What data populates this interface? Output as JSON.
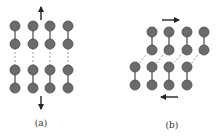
{
  "colors": {
    "atom_fill": "#6b6b6b",
    "atom_stroke": "#4a4a4a",
    "bond": "#555555",
    "broken_bond": "#9a9a9a",
    "arrow": "#222222"
  },
  "panels": [
    {
      "label": "(a)",
      "label_pos": [
        41,
        118
      ],
      "atoms": [
        [
          15,
          26
        ],
        [
          33,
          26
        ],
        [
          50,
          26
        ],
        [
          68,
          26
        ],
        [
          15,
          44
        ],
        [
          33,
          44
        ],
        [
          50,
          44
        ],
        [
          68,
          44
        ],
        [
          15,
          70
        ],
        [
          33,
          70
        ],
        [
          50,
          70
        ],
        [
          68,
          70
        ],
        [
          15,
          88
        ],
        [
          33,
          88
        ],
        [
          50,
          88
        ],
        [
          68,
          88
        ]
      ],
      "bonds": [
        [
          [
            15,
            26
          ],
          [
            15,
            44
          ]
        ],
        [
          [
            33,
            26
          ],
          [
            33,
            44
          ]
        ],
        [
          [
            50,
            26
          ],
          [
            50,
            44
          ]
        ],
        [
          [
            68,
            26
          ],
          [
            68,
            44
          ]
        ],
        [
          [
            15,
            70
          ],
          [
            15,
            88
          ]
        ],
        [
          [
            33,
            70
          ],
          [
            33,
            88
          ]
        ],
        [
          [
            50,
            70
          ],
          [
            50,
            88
          ]
        ],
        [
          [
            68,
            70
          ],
          [
            68,
            88
          ]
        ]
      ],
      "broken_bonds": [
        [
          [
            15,
            48
          ],
          [
            15,
            66
          ]
        ],
        [
          [
            33,
            48
          ],
          [
            33,
            66
          ]
        ],
        [
          [
            50,
            48
          ],
          [
            50,
            66
          ]
        ],
        [
          [
            68,
            48
          ],
          [
            68,
            66
          ]
        ]
      ],
      "arrows": [
        {
          "from": [
            41,
            20
          ],
          "to": [
            41,
            7
          ],
          "direction": "up"
        },
        {
          "from": [
            41,
            96
          ],
          "to": [
            41,
            109
          ],
          "direction": "down"
        }
      ]
    },
    {
      "label": "(b)",
      "label_pos": [
        172,
        120
      ],
      "atoms": [
        [
          152,
          32
        ],
        [
          169,
          32
        ],
        [
          187,
          32
        ],
        [
          204,
          32
        ],
        [
          152,
          50
        ],
        [
          169,
          50
        ],
        [
          187,
          50
        ],
        [
          204,
          50
        ],
        [
          135,
          67
        ],
        [
          152,
          67
        ],
        [
          169,
          67
        ],
        [
          187,
          67
        ],
        [
          135,
          85
        ],
        [
          152,
          85
        ],
        [
          169,
          85
        ],
        [
          187,
          85
        ]
      ],
      "bonds": [
        [
          [
            152,
            32
          ],
          [
            152,
            50
          ]
        ],
        [
          [
            169,
            32
          ],
          [
            169,
            50
          ]
        ],
        [
          [
            187,
            32
          ],
          [
            187,
            50
          ]
        ],
        [
          [
            204,
            32
          ],
          [
            204,
            50
          ]
        ],
        [
          [
            135,
            67
          ],
          [
            135,
            85
          ]
        ],
        [
          [
            152,
            67
          ],
          [
            152,
            85
          ]
        ],
        [
          [
            169,
            67
          ],
          [
            169,
            85
          ]
        ],
        [
          [
            187,
            67
          ],
          [
            187,
            85
          ]
        ]
      ],
      "broken_bonds": [
        [
          [
            148,
            52
          ],
          [
            139,
            64
          ]
        ],
        [
          [
            165,
            52
          ],
          [
            156,
            64
          ]
        ],
        [
          [
            183,
            52
          ],
          [
            173,
            64
          ]
        ],
        [
          [
            200,
            52
          ],
          [
            191,
            64
          ]
        ]
      ],
      "arrows": [
        {
          "from": [
            162,
            20
          ],
          "to": [
            179,
            20
          ],
          "direction": "right"
        },
        {
          "from": [
            178,
            97
          ],
          "to": [
            161,
            97
          ],
          "direction": "left"
        }
      ]
    }
  ],
  "atom_radius": 5
}
